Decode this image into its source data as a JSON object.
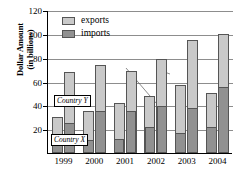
{
  "chart_data": {
    "type": "bar",
    "subtype": "grouped-stacked",
    "title": "",
    "xlabel": "",
    "ylabel_line1": "Dollar Amount",
    "ylabel_line2": "(in billions)",
    "ylim": [
      0,
      120
    ],
    "ytick_labels": [
      "20",
      "40",
      "60",
      "80",
      "100",
      "120"
    ],
    "ytick_values": [
      20,
      40,
      60,
      80,
      100,
      120
    ],
    "grid": true,
    "legend_position": "top-left-inside",
    "categories": [
      "1999",
      "2000",
      "2001",
      "2002",
      "2003",
      "2004"
    ],
    "legend": [
      {
        "label": "exports",
        "color": "#c9c9c9",
        "key": "exports"
      },
      {
        "label": "imports",
        "color": "#919191",
        "key": "imports"
      }
    ],
    "groups": [
      {
        "name": "Country X",
        "bar_class": "x-bar"
      },
      {
        "name": "Country Y",
        "bar_class": "y-bar"
      }
    ],
    "series": [
      {
        "name": "Country X imports",
        "group": "Country X",
        "key": "imports",
        "values": [
          10,
          11,
          12,
          22,
          17,
          22
        ]
      },
      {
        "name": "Country X total",
        "group": "Country X",
        "key": "total",
        "values": [
          30,
          35,
          42,
          48,
          57,
          50
        ]
      },
      {
        "name": "Country Y imports",
        "group": "Country Y",
        "key": "imports",
        "values": [
          25,
          35,
          35,
          39,
          38,
          55
        ]
      },
      {
        "name": "Country Y total",
        "group": "Country Y",
        "key": "total",
        "values": [
          68,
          74,
          69,
          79,
          95,
          100
        ]
      }
    ],
    "annotations": [
      {
        "label": "Country Y",
        "name": "country-y-callout"
      },
      {
        "label": "Country X",
        "name": "country-x-callout"
      }
    ]
  }
}
